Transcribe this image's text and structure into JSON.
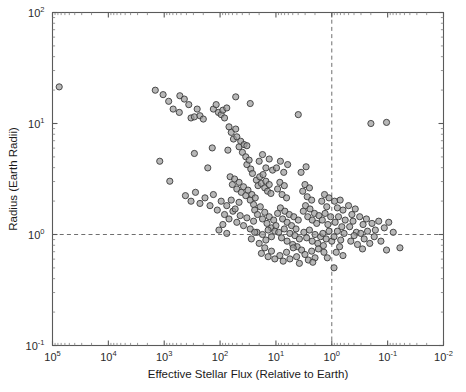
{
  "chart_data": {
    "type": "scatter",
    "title": "",
    "xlabel": "Effective Stellar Flux (Relative to Earth)",
    "ylabel": "Radius (Earth Radii)",
    "x_scale": "log",
    "y_scale": "log",
    "x_reversed": true,
    "xlim": [
      100000,
      0.01
    ],
    "ylim": [
      0.1,
      100
    ],
    "grid": false,
    "legend": null,
    "x_tick_labels": [
      "10^5",
      "10^4",
      "10^3",
      "10^2",
      "10^1",
      "10^0",
      "10^-1",
      "10^-2"
    ],
    "x_tick_values": [
      100000,
      10000,
      1000,
      100,
      10,
      1,
      0.1,
      0.01
    ],
    "y_tick_labels": [
      "10^2",
      "10^1",
      "10^0",
      "10^-1"
    ],
    "y_tick_values": [
      100,
      10,
      1,
      0.1
    ],
    "x_tick_mantissas": [
      "5",
      "4",
      "3",
      "2",
      "1",
      "0",
      "-1",
      "-2"
    ],
    "y_tick_mantissas": [
      "2",
      "1",
      "0",
      "-1"
    ],
    "annotations": [
      {
        "name": "earth-radius-reference",
        "type": "hline",
        "y": 1,
        "style": "dashed"
      },
      {
        "name": "earth-flux-reference",
        "type": "vline",
        "x": 1,
        "style": "dashed"
      }
    ],
    "marker": {
      "shape": "circle",
      "radius_px": 3.1,
      "fill": "#9b9b9b",
      "fill_opacity": 0.72,
      "edge": "#3a3a3a"
    },
    "point_count": 230,
    "points": [
      [
        4.88,
        1.33
      ],
      [
        3.16,
        1.3
      ],
      [
        3.02,
        1.26
      ],
      [
        2.92,
        1.2
      ],
      [
        2.84,
        1.13
      ],
      [
        2.73,
        1.1
      ],
      [
        2.72,
        1.25
      ],
      [
        2.64,
        1.22
      ],
      [
        2.56,
        1.17
      ],
      [
        2.52,
        1.05
      ],
      [
        2.46,
        1.06
      ],
      [
        2.41,
        1.13
      ],
      [
        2.36,
        1.07
      ],
      [
        2.3,
        1.04
      ],
      [
        2.12,
        1.13
      ],
      [
        2.07,
        1.17
      ],
      [
        2.03,
        1.1
      ],
      [
        1.98,
        1.08
      ],
      [
        1.95,
        1.12
      ],
      [
        1.92,
        1.05
      ],
      [
        1.88,
        1.14
      ],
      [
        3.08,
        0.66
      ],
      [
        2.9,
        0.48
      ],
      [
        2.62,
        0.35
      ],
      [
        2.52,
        0.3
      ],
      [
        2.44,
        0.38
      ],
      [
        2.36,
        0.28
      ],
      [
        2.27,
        0.33
      ],
      [
        2.18,
        0.26
      ],
      [
        2.12,
        0.36
      ],
      [
        2.05,
        0.22
      ],
      [
        1.98,
        0.3
      ],
      [
        2.46,
        0.73
      ],
      [
        2.22,
        0.6
      ],
      [
        1.84,
        0.97
      ],
      [
        1.8,
        0.92
      ],
      [
        1.76,
        0.86
      ],
      [
        1.72,
        0.95
      ],
      [
        1.7,
        0.88
      ],
      [
        1.66,
        0.79
      ],
      [
        1.63,
        0.84
      ],
      [
        1.6,
        0.74
      ],
      [
        1.57,
        0.81
      ],
      [
        1.54,
        0.7
      ],
      [
        1.52,
        0.63
      ],
      [
        1.48,
        0.67
      ],
      [
        1.45,
        0.59
      ],
      [
        1.42,
        0.55
      ],
      [
        1.86,
        0.76
      ],
      [
        1.82,
        0.52
      ],
      [
        1.78,
        0.45
      ],
      [
        1.74,
        0.5
      ],
      [
        1.7,
        0.41
      ],
      [
        1.66,
        0.47
      ],
      [
        1.62,
        0.38
      ],
      [
        1.58,
        0.43
      ],
      [
        1.54,
        0.35
      ],
      [
        1.5,
        0.4
      ],
      [
        1.46,
        0.31
      ],
      [
        1.43,
        0.36
      ],
      [
        1.4,
        0.27
      ],
      [
        1.37,
        0.33
      ],
      [
        1.92,
        0.18
      ],
      [
        1.84,
        0.14
      ],
      [
        1.77,
        0.21
      ],
      [
        1.7,
        0.11
      ],
      [
        1.64,
        0.17
      ],
      [
        1.58,
        0.08
      ],
      [
        1.52,
        0.15
      ],
      [
        1.46,
        0.05
      ],
      [
        1.4,
        0.12
      ],
      [
        1.34,
        0.02
      ],
      [
        1.88,
        0.26
      ],
      [
        1.8,
        0.31
      ],
      [
        1.73,
        0.23
      ],
      [
        1.66,
        0.29
      ],
      [
        2.02,
        0.04
      ],
      [
        1.95,
        0.09
      ],
      [
        1.88,
        0.01
      ],
      [
        1.35,
        0.49
      ],
      [
        1.32,
        0.44
      ],
      [
        1.29,
        0.52
      ],
      [
        1.26,
        0.46
      ],
      [
        1.23,
        0.54
      ],
      [
        1.2,
        0.42
      ],
      [
        1.18,
        0.48
      ],
      [
        1.15,
        0.39
      ],
      [
        1.12,
        0.45
      ],
      [
        1.09,
        0.37
      ],
      [
        1.38,
        0.22
      ],
      [
        1.33,
        0.18
      ],
      [
        1.28,
        0.25
      ],
      [
        1.24,
        0.14
      ],
      [
        1.2,
        0.2
      ],
      [
        1.16,
        0.1
      ],
      [
        1.12,
        0.16
      ],
      [
        1.08,
        0.06
      ],
      [
        1.04,
        0.13
      ],
      [
        1.0,
        0.08
      ],
      [
        1.3,
        0.66
      ],
      [
        1.24,
        0.72
      ],
      [
        1.18,
        0.6
      ],
      [
        1.12,
        0.68
      ],
      [
        1.06,
        0.58
      ],
      [
        1.44,
        -0.04
      ],
      [
        1.38,
        0.02
      ],
      [
        1.3,
        -0.08
      ],
      [
        1.24,
        0.0
      ],
      [
        1.18,
        -0.05
      ],
      [
        1.14,
        0.04
      ],
      [
        1.08,
        -0.02
      ],
      [
        1.02,
        0.03
      ],
      [
        1.26,
        -0.17
      ],
      [
        1.2,
        -0.12
      ],
      [
        1.14,
        -0.2
      ],
      [
        1.08,
        -0.15
      ],
      [
        1.02,
        -0.22
      ],
      [
        0.97,
        0.41
      ],
      [
        0.93,
        0.47
      ],
      [
        0.89,
        0.36
      ],
      [
        0.85,
        0.44
      ],
      [
        0.81,
        0.33
      ],
      [
        0.97,
        0.19
      ],
      [
        0.92,
        0.24
      ],
      [
        0.88,
        0.14
      ],
      [
        0.84,
        0.21
      ],
      [
        0.8,
        0.11
      ],
      [
        0.76,
        0.18
      ],
      [
        0.72,
        0.08
      ],
      [
        0.68,
        0.16
      ],
      [
        0.64,
        0.05
      ],
      [
        0.6,
        0.13
      ],
      [
        0.95,
        0.02
      ],
      [
        0.9,
        -0.03
      ],
      [
        0.85,
        0.05
      ],
      [
        0.8,
        -0.06
      ],
      [
        0.75,
        0.01
      ],
      [
        0.7,
        -0.09
      ],
      [
        0.66,
        -0.01
      ],
      [
        0.62,
        -0.11
      ],
      [
        0.58,
        -0.04
      ],
      [
        0.54,
        -0.14
      ],
      [
        0.93,
        -0.19
      ],
      [
        0.87,
        -0.24
      ],
      [
        0.81,
        -0.16
      ],
      [
        0.75,
        -0.22
      ],
      [
        0.69,
        -0.12
      ],
      [
        0.63,
        -0.2
      ],
      [
        0.58,
        -0.26
      ],
      [
        0.99,
        0.6
      ],
      [
        0.92,
        0.66
      ],
      [
        0.86,
        0.56
      ],
      [
        0.79,
        0.63
      ],
      [
        0.52,
        0.39
      ],
      [
        0.48,
        0.45
      ],
      [
        0.44,
        0.34
      ],
      [
        0.4,
        0.42
      ],
      [
        0.36,
        0.31
      ],
      [
        0.51,
        0.21
      ],
      [
        0.47,
        0.26
      ],
      [
        0.43,
        0.16
      ],
      [
        0.39,
        0.23
      ],
      [
        0.35,
        0.13
      ],
      [
        0.31,
        0.19
      ],
      [
        0.27,
        0.1
      ],
      [
        0.23,
        0.17
      ],
      [
        0.5,
        0.02
      ],
      [
        0.45,
        -0.03
      ],
      [
        0.4,
        0.04
      ],
      [
        0.35,
        -0.06
      ],
      [
        0.3,
        0.0
      ],
      [
        0.25,
        -0.08
      ],
      [
        0.2,
        -0.02
      ],
      [
        0.15,
        -0.1
      ],
      [
        0.48,
        -0.18
      ],
      [
        0.42,
        -0.23
      ],
      [
        0.36,
        -0.15
      ],
      [
        0.3,
        -0.21
      ],
      [
        0.24,
        -0.13
      ],
      [
        0.55,
        0.56
      ],
      [
        0.46,
        0.61
      ],
      [
        0.18,
        0.3
      ],
      [
        0.13,
        0.36
      ],
      [
        0.09,
        0.25
      ],
      [
        0.05,
        0.33
      ],
      [
        0.17,
        0.13
      ],
      [
        0.12,
        0.19
      ],
      [
        0.07,
        0.09
      ],
      [
        0.02,
        0.16
      ],
      [
        0.16,
        0.01
      ],
      [
        0.1,
        -0.04
      ],
      [
        0.05,
        0.03
      ],
      [
        0.0,
        -0.06
      ],
      [
        0.14,
        -0.16
      ],
      [
        0.08,
        -0.21
      ],
      [
        -0.05,
        0.3
      ],
      [
        -0.1,
        0.24
      ],
      [
        -0.15,
        0.31
      ],
      [
        -0.2,
        0.22
      ],
      [
        -0.06,
        0.11
      ],
      [
        -0.12,
        0.16
      ],
      [
        -0.18,
        0.07
      ],
      [
        -0.24,
        0.13
      ],
      [
        -0.04,
        -0.02
      ],
      [
        -0.1,
        0.03
      ],
      [
        -0.16,
        -0.05
      ],
      [
        -0.22,
        0.01
      ],
      [
        -0.08,
        -0.16
      ],
      [
        -0.14,
        -0.11
      ],
      [
        -0.2,
        -0.19
      ],
      [
        -0.3,
        0.26
      ],
      [
        -0.36,
        0.18
      ],
      [
        -0.42,
        0.23
      ],
      [
        -0.32,
        0.07
      ],
      [
        -0.38,
        0.12
      ],
      [
        -0.44,
        0.02
      ],
      [
        -0.34,
        -0.06
      ],
      [
        -0.4,
        -0.01
      ],
      [
        -0.46,
        -0.09
      ],
      [
        -0.5,
        0.16
      ],
      [
        -0.56,
        0.09
      ],
      [
        -0.62,
        0.14
      ],
      [
        -0.52,
        0.01
      ],
      [
        -0.58,
        -0.04
      ],
      [
        -0.64,
        0.03
      ],
      [
        -0.55,
        -0.13
      ],
      [
        -0.68,
        -0.08
      ],
      [
        -0.72,
        0.1
      ],
      [
        -0.78,
        0.04
      ],
      [
        -0.84,
        0.12
      ],
      [
        -0.76,
        -0.02
      ],
      [
        -0.88,
        -0.06
      ],
      [
        -0.94,
        0.06
      ],
      [
        -1.02,
        0.11
      ],
      [
        -1.1,
        0.02
      ],
      [
        -0.98,
        -0.14
      ],
      [
        -1.22,
        -0.12
      ],
      [
        -0.7,
        1.0
      ],
      [
        -0.98,
        1.01
      ],
      [
        1.72,
        1.24
      ],
      [
        1.46,
        1.18
      ],
      [
        0.6,
        1.08
      ],
      [
        2.14,
        0.78
      ],
      [
        1.52,
        0.8
      ],
      [
        -0.04,
        -0.3
      ],
      [
        0.34,
        -0.25
      ]
    ]
  }
}
